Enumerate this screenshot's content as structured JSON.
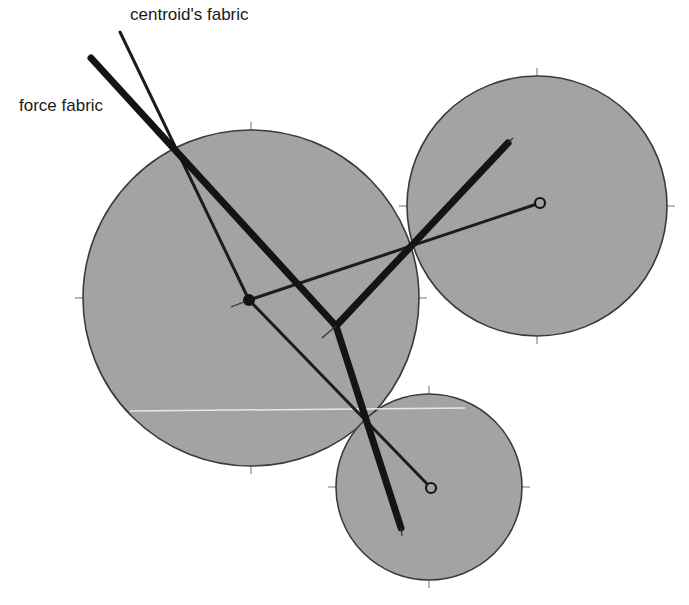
{
  "diagram": {
    "labels": {
      "centroid_fabric": "centroid's fabric",
      "force_fabric": "force fabric"
    },
    "label_positions": {
      "centroid_fabric": {
        "x": 130,
        "y": 6
      },
      "force_fabric": {
        "x": 19,
        "y": 97
      }
    },
    "colors": {
      "background": "#ffffff",
      "particle_fill": "#a3a3a3",
      "particle_outline": "#3a3a3a",
      "tick": "#b8b8b8",
      "force_line": "#141414",
      "centroid_line": "#1c1c1c",
      "highlight_line": "#e8e8e8"
    },
    "particles": [
      {
        "id": "large",
        "cx": 251,
        "cy": 298,
        "r": 168,
        "centroid": {
          "x": 249,
          "y": 300,
          "style": "filled"
        }
      },
      {
        "id": "right",
        "cx": 537,
        "cy": 206,
        "r": 130,
        "centroid": {
          "x": 540,
          "y": 203,
          "style": "open"
        }
      },
      {
        "id": "bottom",
        "cx": 429,
        "cy": 487,
        "r": 93,
        "centroid": {
          "x": 431,
          "y": 488,
          "style": "open"
        }
      }
    ],
    "force_fabric_segments": [
      {
        "x1": 91,
        "y1": 58,
        "x2": 336,
        "y2": 326
      },
      {
        "x1": 336,
        "y1": 326,
        "x2": 508,
        "y2": 143
      },
      {
        "x1": 336,
        "y1": 326,
        "x2": 401,
        "y2": 528
      }
    ],
    "centroid_fabric_segments": [
      {
        "x1": 120,
        "y1": 32,
        "x2": 249,
        "y2": 300
      },
      {
        "x1": 249,
        "y1": 300,
        "x2": 540,
        "y2": 203
      },
      {
        "x1": 249,
        "y1": 300,
        "x2": 431,
        "y2": 488
      }
    ],
    "tails": [
      {
        "x1": 249,
        "y1": 300,
        "x2": 231,
        "y2": 307
      },
      {
        "x1": 336,
        "y1": 326,
        "x2": 322,
        "y2": 338
      },
      {
        "x1": 508,
        "y1": 143,
        "x2": 513,
        "y2": 138
      },
      {
        "x1": 401,
        "y1": 528,
        "x2": 402,
        "y2": 536
      }
    ],
    "highlight_line": {
      "x1": 130,
      "y1": 411,
      "x2": 465,
      "y2": 408
    }
  }
}
